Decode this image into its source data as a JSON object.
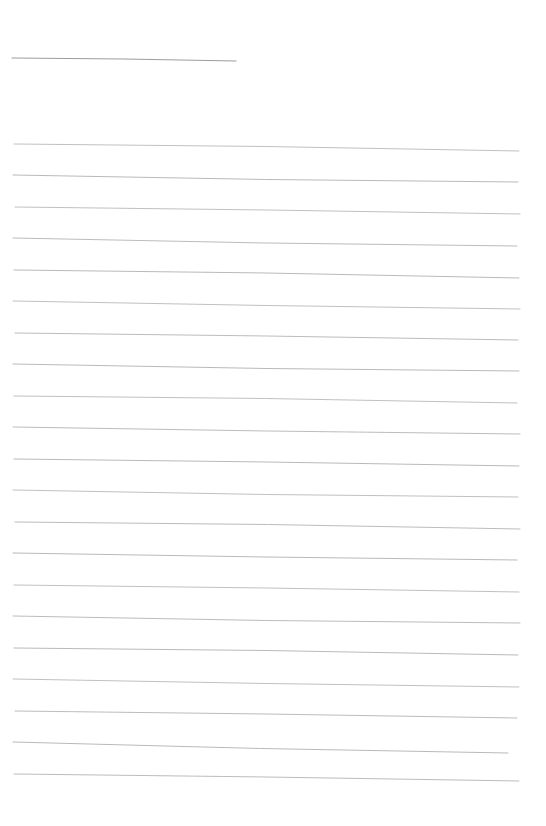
{
  "page": {
    "kind": "blank-lined-paper-scan",
    "background": "#ffffff",
    "width": 546,
    "height": 826,
    "text_content": ""
  },
  "title_underline": {
    "x1": 12,
    "y1": 58,
    "x2": 236,
    "y2": 61,
    "color": "#9c9c9c",
    "stroke_width": 1,
    "bend": -1
  },
  "ruled_lines": {
    "color": "#b5b5b5",
    "stroke_width": 1,
    "count": 21,
    "spacing_px": 31.5,
    "lines": [
      {
        "x1": 14,
        "y1": 144,
        "x2": 519,
        "y2": 151,
        "bend": -2,
        "opacity": 0.85
      },
      {
        "x1": 13,
        "y1": 175,
        "x2": 518,
        "y2": 182,
        "bend": 2,
        "opacity": 0.95
      },
      {
        "x1": 15,
        "y1": 207,
        "x2": 520,
        "y2": 214,
        "bend": -1,
        "opacity": 0.85
      },
      {
        "x1": 13,
        "y1": 238,
        "x2": 517,
        "y2": 246,
        "bend": 2,
        "opacity": 0.9
      },
      {
        "x1": 14,
        "y1": 270,
        "x2": 519,
        "y2": 278,
        "bend": -2,
        "opacity": 0.95
      },
      {
        "x1": 13,
        "y1": 301,
        "x2": 520,
        "y2": 309,
        "bend": 1,
        "opacity": 0.85
      },
      {
        "x1": 15,
        "y1": 333,
        "x2": 518,
        "y2": 340,
        "bend": -1,
        "opacity": 0.9
      },
      {
        "x1": 13,
        "y1": 364,
        "x2": 519,
        "y2": 371,
        "bend": 2,
        "opacity": 0.95
      },
      {
        "x1": 14,
        "y1": 396,
        "x2": 517,
        "y2": 403,
        "bend": -2,
        "opacity": 0.85
      },
      {
        "x1": 13,
        "y1": 427,
        "x2": 520,
        "y2": 434,
        "bend": 1,
        "opacity": 0.9
      },
      {
        "x1": 14,
        "y1": 459,
        "x2": 519,
        "y2": 466,
        "bend": -1,
        "opacity": 0.95
      },
      {
        "x1": 13,
        "y1": 490,
        "x2": 518,
        "y2": 497,
        "bend": 2,
        "opacity": 0.85
      },
      {
        "x1": 15,
        "y1": 522,
        "x2": 520,
        "y2": 529,
        "bend": -2,
        "opacity": 0.9
      },
      {
        "x1": 13,
        "y1": 553,
        "x2": 517,
        "y2": 560,
        "bend": 1,
        "opacity": 0.95
      },
      {
        "x1": 14,
        "y1": 585,
        "x2": 519,
        "y2": 592,
        "bend": -1,
        "opacity": 0.85
      },
      {
        "x1": 13,
        "y1": 616,
        "x2": 520,
        "y2": 623,
        "bend": 2,
        "opacity": 0.9
      },
      {
        "x1": 14,
        "y1": 648,
        "x2": 518,
        "y2": 655,
        "bend": -2,
        "opacity": 0.95
      },
      {
        "x1": 13,
        "y1": 679,
        "x2": 519,
        "y2": 687,
        "bend": 1,
        "opacity": 0.85
      },
      {
        "x1": 15,
        "y1": 711,
        "x2": 517,
        "y2": 718,
        "bend": -1,
        "opacity": 0.9
      },
      {
        "x1": 13,
        "y1": 742,
        "x2": 508,
        "y2": 753,
        "bend": 2,
        "opacity": 0.95
      },
      {
        "x1": 14,
        "y1": 774,
        "x2": 519,
        "y2": 781,
        "bend": -1,
        "opacity": 0.9
      }
    ]
  }
}
